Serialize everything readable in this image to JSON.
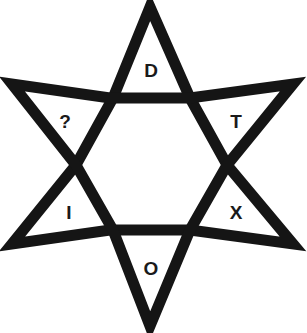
{
  "puzzle": {
    "shape": "six-pointed-star",
    "stroke_color": "#151515",
    "background": "#ffffff",
    "points": [
      {
        "position": "top",
        "label": "D"
      },
      {
        "position": "upper-left",
        "label": "?"
      },
      {
        "position": "upper-right",
        "label": "T"
      },
      {
        "position": "lower-left",
        "label": "I"
      },
      {
        "position": "lower-right",
        "label": "X"
      },
      {
        "position": "bottom",
        "label": "O"
      }
    ]
  }
}
